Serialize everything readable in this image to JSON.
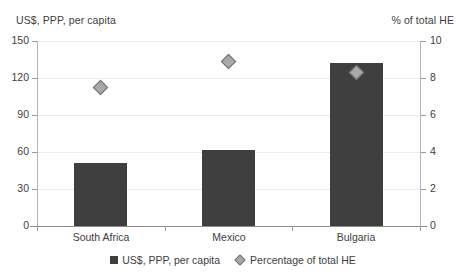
{
  "chart_data": {
    "type": "bar",
    "title": "",
    "categories": [
      "South Africa",
      "Mexico",
      "Bulgaria"
    ],
    "series": [
      {
        "name": "US$, PPP, per capita",
        "kind": "bar",
        "axis": "left",
        "color": "#3f3f3f",
        "values": [
          51,
          62,
          132
        ]
      },
      {
        "name": "Percentage of total HE",
        "kind": "scatter",
        "axis": "right",
        "marker": "diamond",
        "color": "#a9a9a9",
        "values": [
          7.5,
          8.9,
          8.3
        ]
      }
    ],
    "xlabel": "",
    "ylabel": "US$, PPP, per capita",
    "y2label": "% of total HE",
    "ylim": [
      0,
      150
    ],
    "y2lim": [
      0,
      10
    ],
    "yticks": [
      "0",
      "30",
      "60",
      "90",
      "120",
      "150"
    ],
    "y2ticks": [
      "0",
      "2",
      "4",
      "6",
      "8",
      "10"
    ],
    "ytick_values": [
      0,
      30,
      60,
      90,
      120,
      150
    ],
    "y2tick_values": [
      0,
      2,
      4,
      6,
      8,
      10
    ],
    "grid": true,
    "legend_position": "bottom"
  },
  "axes": {
    "left_title": "US$, PPP, per capita",
    "right_title": "% of total HE"
  },
  "legend": {
    "items": [
      {
        "label": "US$, PPP, per capita",
        "marker": "square",
        "color": "#3f3f3f"
      },
      {
        "label": "Percentage of total HE",
        "marker": "diamond",
        "color": "#a9a9a9"
      }
    ]
  },
  "colors": {
    "bar": "#3f3f3f",
    "marker_fill": "#a9a9a9",
    "marker_edge": "#6e6e6e",
    "gridline": "#ededed",
    "axis": "#9a9a9a",
    "text": "#3d3d3d",
    "background": "#ffffff"
  }
}
